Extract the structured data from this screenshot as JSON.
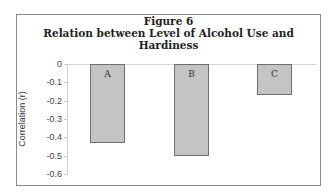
{
  "figure": {
    "label": "Figure 6",
    "title": "Relation between Level of Alcohol Use and Hardiness"
  },
  "chart_data": {
    "type": "bar",
    "title": "Relation between Level of Alcohol Use and Hardiness",
    "subtitle": "Figure 6",
    "categories": [
      "A",
      "B",
      "C"
    ],
    "values": [
      -0.43,
      -0.5,
      -0.17
    ],
    "xlabel": "",
    "ylabel": "Correlation (r)",
    "ylim": [
      -0.6,
      0
    ],
    "yticks": [
      "0",
      "-0.1",
      "-0.2",
      "-0.3",
      "-0.4",
      "-0.5",
      "-0.6"
    ],
    "grid": false,
    "legend": null,
    "bar_color": "#c4c4c4",
    "bar_edge_color": "#6f6f6f"
  }
}
